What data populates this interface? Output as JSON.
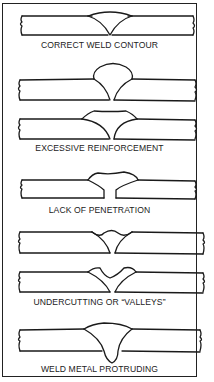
{
  "figure": {
    "stroke_color": "#1a1a1a",
    "background": "#ffffff",
    "panels": [
      {
        "id": "correct",
        "label": "CORRECT WELD CONTOUR"
      },
      {
        "id": "excessive",
        "label": "EXCESSIVE REINFORCEMENT"
      },
      {
        "id": "lack",
        "label": "LACK OF PENETRATION"
      },
      {
        "id": "undercut",
        "label": "UNDERCUTTING OR “VALLEYS”"
      },
      {
        "id": "protruding",
        "label": "WELD METAL PROTRUDING"
      }
    ]
  }
}
